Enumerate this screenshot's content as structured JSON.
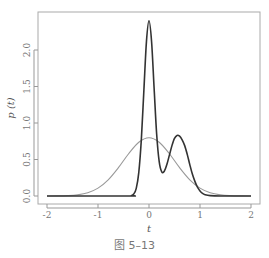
{
  "chart_data": {
    "type": "line",
    "title": "",
    "xlabel": "t",
    "ylabel": "p (t)",
    "xlim": [
      -2,
      2
    ],
    "ylim": [
      0,
      2.5
    ],
    "grid": false,
    "legend": null,
    "x_ticks": [
      "-2",
      "-1",
      "0",
      "1",
      "2"
    ],
    "y_ticks": [
      "0.0",
      "0.5",
      "1.0",
      "1.5",
      "2.0"
    ],
    "series": [
      {
        "name": "bimodal density (dark)",
        "color": "#333333",
        "x": [
          -2.0,
          -0.4,
          -0.35,
          -0.3,
          -0.25,
          -0.2,
          -0.15,
          -0.1,
          -0.05,
          0.0,
          0.05,
          0.1,
          0.15,
          0.2,
          0.25,
          0.3,
          0.35,
          0.4,
          0.45,
          0.5,
          0.55,
          0.6,
          0.65,
          0.7,
          0.75,
          0.8,
          0.85,
          0.9,
          0.95,
          1.0,
          1.05,
          1.1,
          1.2,
          1.4,
          2.0
        ],
        "values": [
          0.0,
          0.0,
          0.005,
          0.027,
          0.105,
          0.324,
          0.776,
          1.452,
          2.115,
          2.4,
          2.12,
          1.48,
          0.85,
          0.47,
          0.33,
          0.34,
          0.43,
          0.56,
          0.69,
          0.79,
          0.83,
          0.82,
          0.77,
          0.69,
          0.57,
          0.43,
          0.3,
          0.2,
          0.12,
          0.07,
          0.035,
          0.018,
          0.005,
          0.0,
          0.0
        ]
      },
      {
        "name": "normal density (light)",
        "color": "#999999",
        "x": [
          -2.0,
          -1.8,
          -1.6,
          -1.4,
          -1.2,
          -1.0,
          -0.8,
          -0.6,
          -0.4,
          -0.2,
          0.0,
          0.2,
          0.4,
          0.6,
          0.8,
          1.0,
          1.2,
          1.4,
          1.6,
          1.8,
          2.0
        ],
        "values": [
          0.0003,
          0.0012,
          0.0048,
          0.0159,
          0.0448,
          0.108,
          0.222,
          0.388,
          0.579,
          0.737,
          0.798,
          0.737,
          0.579,
          0.388,
          0.222,
          0.108,
          0.0448,
          0.0159,
          0.0048,
          0.0012,
          0.0003
        ]
      }
    ]
  },
  "caption": "图 5–13"
}
